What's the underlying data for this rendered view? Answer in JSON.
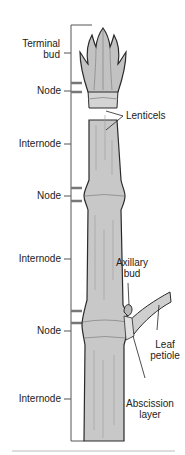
{
  "diagram": {
    "colors": {
      "stem_fill": "#c8c8c8",
      "stem_light": "#dedede",
      "outline": "#2a2a2a",
      "bracket": "#555555",
      "node_tick": "#777777",
      "background": "#ffffff"
    },
    "left_labels": [
      {
        "id": "terminal-bud",
        "line1": "Terminal",
        "line2": "bud"
      },
      {
        "id": "node-1",
        "line1": "Node"
      },
      {
        "id": "internode-1",
        "line1": "Internode"
      },
      {
        "id": "node-2",
        "line1": "Node"
      },
      {
        "id": "internode-2",
        "line1": "Internode"
      },
      {
        "id": "node-3",
        "line1": "Node"
      },
      {
        "id": "internode-3",
        "line1": "Internode"
      }
    ],
    "right_labels": [
      {
        "id": "lenticels",
        "line1": "Lenticels"
      },
      {
        "id": "axillary-bud",
        "line1": "Axillary",
        "line2": "bud"
      },
      {
        "id": "leaf-petiole",
        "line1": "Leaf",
        "line2": "petiole"
      },
      {
        "id": "abscission-layer",
        "line1": "Abscission",
        "line2": "layer"
      }
    ]
  }
}
